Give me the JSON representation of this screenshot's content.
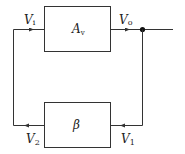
{
  "diagram": {
    "type": "feedback-loop block diagram",
    "blocks": [
      {
        "id": "amplifier",
        "label": "A",
        "subscript": "v"
      },
      {
        "id": "feedback",
        "label": "β",
        "subscript": ""
      }
    ],
    "signals": [
      {
        "id": "vi",
        "label": "V",
        "subscript": "i"
      },
      {
        "id": "vo",
        "label": "V",
        "subscript": "o"
      },
      {
        "id": "v1",
        "label": "V",
        "subscript": "1"
      },
      {
        "id": "v2",
        "label": "V",
        "subscript": "2"
      }
    ],
    "colors": {
      "line": "#333333",
      "background": "#ffffff"
    }
  }
}
